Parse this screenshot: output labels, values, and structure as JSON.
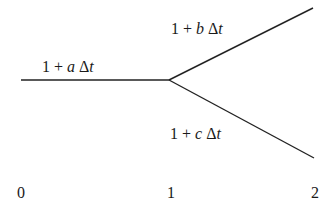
{
  "diagram": {
    "type": "branching-tree",
    "line_color": "#222222",
    "nodes": [
      {
        "id": "start",
        "x": 21,
        "y": 80
      },
      {
        "id": "branch",
        "x": 169,
        "y": 80
      },
      {
        "id": "upper-end",
        "x": 313,
        "y": 8
      },
      {
        "id": "lower-end",
        "x": 314,
        "y": 158
      }
    ],
    "edges": [
      {
        "from": "start",
        "to": "branch",
        "label": {
          "pre": "1 + ",
          "var": "a",
          "post": " Δ",
          "var2": "t"
        }
      },
      {
        "from": "branch",
        "to": "upper-end",
        "label": {
          "pre": "1 + ",
          "var": "b",
          "post": " Δ",
          "var2": "t"
        }
      },
      {
        "from": "branch",
        "to": "lower-end",
        "label": {
          "pre": "1 + ",
          "var": "c",
          "post": " Δ",
          "var2": "t"
        }
      }
    ],
    "axis_ticks": [
      "0",
      "1",
      "2"
    ]
  }
}
